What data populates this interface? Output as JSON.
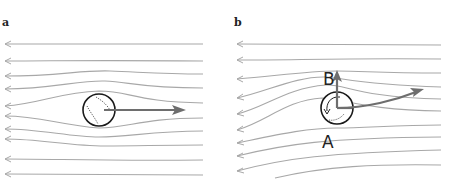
{
  "figure": {
    "panels": [
      {
        "id": "a",
        "label": "a",
        "description": "Flow around a non-spinning ball: symmetric streamlines, velocity arrow to the right"
      },
      {
        "id": "b",
        "label": "b",
        "description": "Flow around a spinning ball (Magnus effect): asymmetric streamlines, lift arrow upward and curved trajectory",
        "point_labels": {
          "top": "B",
          "bottom": "A"
        }
      }
    ],
    "colors": {
      "streamline": "#a8a8a8",
      "vector": "#6e6e6e",
      "ball_outline": "#1a1a1a",
      "background": "#ffffff"
    }
  }
}
